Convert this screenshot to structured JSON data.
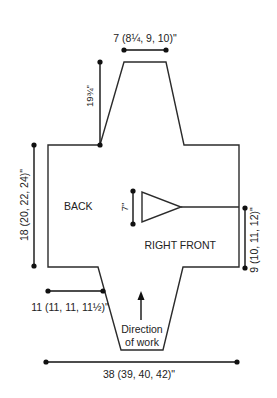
{
  "diagram": {
    "type": "knitting-schematic",
    "pieces": {
      "back_label": "BACK",
      "right_front_label": "RIGHT FRONT"
    },
    "measurements": {
      "collar_width": "7 (8¼, 9, 10)\"",
      "shoulder_slope": "19¾\"",
      "back_length": "18 (20, 22, 24)\"",
      "armhole_depth": "7\"",
      "right_front_length": "9 (10, 11, 12)\"",
      "sleeve_cuff": "11 (11, 11, 11½)\"",
      "total_width": "38 (39, 40, 42)\""
    },
    "direction": {
      "line1": "Direction",
      "line2": "of work",
      "arrow": "up-arrow"
    },
    "colors": {
      "line": "#2b2b2b",
      "dimension": "#111111",
      "background": "#ffffff"
    }
  }
}
